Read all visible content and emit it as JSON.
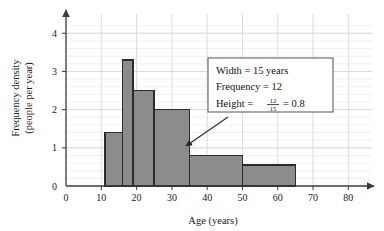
{
  "chart_data": {
    "type": "bar",
    "title": "",
    "subtitle": "",
    "xlabel": "Age (years)",
    "ylabel": "Frequency density\n(people per year)",
    "ylabel_line1": "Frequency density",
    "ylabel_line2": "(people per year)",
    "xlim": [
      0,
      85
    ],
    "ylim": [
      0,
      4.4
    ],
    "xticks": [
      0,
      10,
      20,
      30,
      40,
      50,
      60,
      70,
      80
    ],
    "xtick_labels": [
      "0",
      "10",
      "20",
      "30",
      "40",
      "50",
      "60",
      "70",
      "80"
    ],
    "yticks": [
      0,
      1,
      2,
      3,
      4
    ],
    "ytick_labels": [
      "0",
      "1",
      "2",
      "3",
      "4"
    ],
    "grid": true,
    "grid_minor_y_step": 0.2,
    "grid_major_x_step": 10,
    "legend": "none",
    "bins": [
      {
        "label": "11-16",
        "x0": 11,
        "x1": 16,
        "height": 1.4
      },
      {
        "label": "16-19",
        "x0": 16,
        "x1": 19,
        "height": 3.3
      },
      {
        "label": "19-25",
        "x0": 19,
        "x1": 25,
        "height": 2.5
      },
      {
        "label": "25-35",
        "x0": 25,
        "x1": 35,
        "height": 2.0
      },
      {
        "label": "35-50",
        "x0": 35,
        "x1": 50,
        "height": 0.8
      },
      {
        "label": "50-65",
        "x0": 50,
        "x1": 65,
        "height": 0.55
      }
    ],
    "categories": [
      "11-16",
      "16-19",
      "19-25",
      "25-35",
      "35-50",
      "50-65"
    ],
    "values": [
      1.4,
      3.3,
      2.5,
      2.0,
      0.8,
      0.55
    ],
    "annotations": [
      {
        "name": "callout",
        "lines": [
          "Width = 15 years",
          "Frequency = 12",
          "Height = 12/15 = 0.8"
        ],
        "line1": "Width = 15 years",
        "line2": "Frequency = 12",
        "line3_prefix": "Height  =",
        "line3_numerator": "12",
        "line3_denominator": "15",
        "line3_suffix": "= 0.8",
        "points_to_bin": "35-50"
      }
    ],
    "colors": {
      "bar_fill": "#8c8c8c",
      "bar_edge": "#2b2b2b",
      "axis": "#4a4a4a",
      "grid_major": "#d8d8d8",
      "grid_minor": "#ededed",
      "text": "#1a1a1a",
      "callout_border": "#6e6e6e",
      "callout_bg": "#ffffff",
      "arrow": "#2b2b2b",
      "background": "#ffffff"
    }
  }
}
